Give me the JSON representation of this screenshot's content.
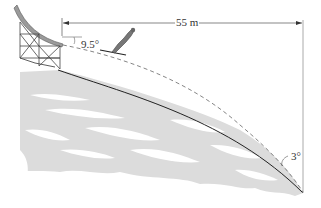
{
  "figure": {
    "labels": {
      "horizontal_distance": "55 m",
      "takeoff_angle": "9.5°",
      "landing_slope_angle": "3°"
    },
    "colors": {
      "line": "#333333",
      "snow_shadow": "#d9d9d9",
      "ramp": "#777777",
      "background": "#ffffff"
    },
    "elements": [
      "takeoff ramp with lattice tower",
      "ski jumper",
      "dashed flight trajectory",
      "landing hill profile",
      "horizontal dimension line",
      "vertical reference line"
    ]
  }
}
